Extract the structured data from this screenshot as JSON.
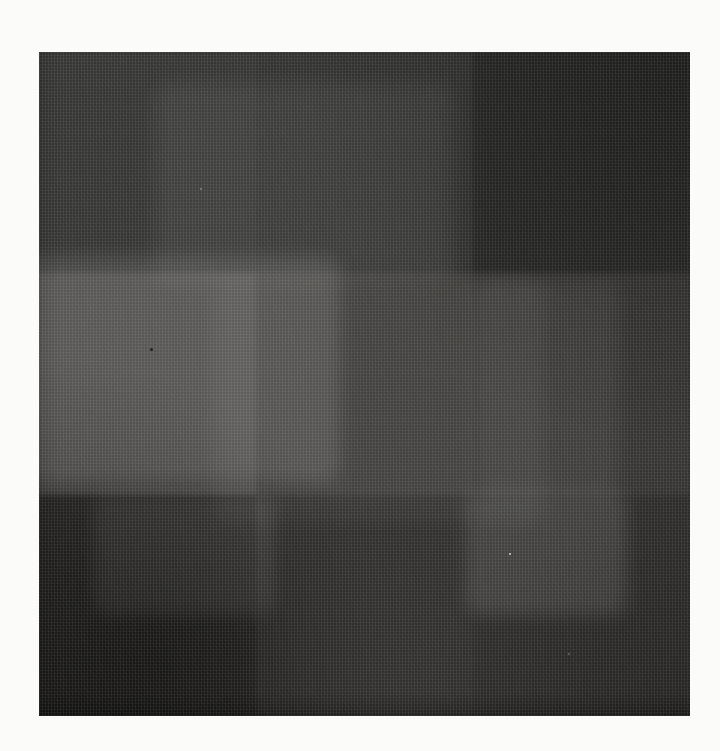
{
  "page": {
    "background_color": "#fbfbfa"
  },
  "artwork": {
    "type": "black-and-white photograph of an abstract painting",
    "description": "Near-black square canvas divided into a 3-by-3 grid of subtly different dark gray tones, with fine woven canvas texture, lighter patches in the middle-left and upper bottom corners, and very dark top-right and bottom-left corners",
    "base_color": "#343433",
    "cells": [
      {
        "name": "top-left",
        "color": "#3a3a39"
      },
      {
        "name": "top-center",
        "color": "#373735"
      },
      {
        "name": "top-right",
        "color": "#2b2b2a"
      },
      {
        "name": "middle-left",
        "color": "#4b4a47"
      },
      {
        "name": "center",
        "color": "#403f3c"
      },
      {
        "name": "middle-right",
        "color": "#3a3937"
      },
      {
        "name": "bottom-left",
        "color": "#2c2b29"
      },
      {
        "name": "bottom-center",
        "color": "#353432"
      },
      {
        "name": "bottom-right",
        "color": "#32312f"
      }
    ],
    "specks": [
      {
        "x": 470,
        "y": 501,
        "size": 2,
        "color": "rgba(255,255,255,0.75)"
      },
      {
        "x": 161,
        "y": 136,
        "size": 2,
        "color": "rgba(255,255,255,0.35)"
      },
      {
        "x": 111,
        "y": 296,
        "size": 3,
        "color": "rgba(0,0,0,0.65)"
      },
      {
        "x": 529,
        "y": 601,
        "size": 2,
        "color": "rgba(255,255,255,0.28)"
      }
    ]
  }
}
